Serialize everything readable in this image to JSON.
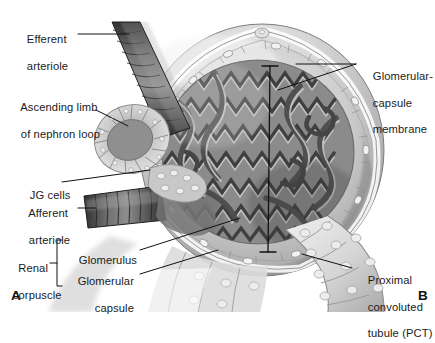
{
  "figure": {
    "background_color": "#ffffff",
    "text_color": "#1b1b1b",
    "leader_line_color": "#111111"
  },
  "panels": [
    {
      "id": "A",
      "label": "A",
      "x": 11,
      "y": 288
    },
    {
      "id": "B",
      "label": "B",
      "x": 418,
      "y": 288
    }
  ],
  "labels": {
    "efferent_arteriole": {
      "line1": "Efferent",
      "line2": "arteriole"
    },
    "ascending_limb": {
      "line1": "Ascending limb",
      "line2": "of nephron loop"
    },
    "jg_cells": {
      "line1": "JG cells"
    },
    "afferent_arteriole": {
      "line1": "Afferent",
      "line2": "arteriole"
    },
    "renal_corpuscle": {
      "line1": "Renal",
      "line2": "corpuscle"
    },
    "glomerulus": {
      "line1": "Glomerulus"
    },
    "glomerular_capsule": {
      "line1": "Glomerular",
      "line2": "capsule"
    },
    "glomerular_capsule_membrane": {
      "line1": "Glomerular-",
      "line2": "capsule",
      "line3": "membrane"
    },
    "proximal_convoluted_tubule": {
      "line1": "Proximal",
      "line2": "convoluted",
      "line3": "tubule (PCT)"
    }
  },
  "structures": {
    "efferent_arteriole": "segmented dark vascular tube entering from upper area",
    "afferent_arteriole": "segmented dark vascular tube entering from left",
    "ascending_limb": "cup-shaped cellular tubule cross-section at left",
    "jg_cells": "juxtaglomerular cell cluster at arteriole wall",
    "glomerulus": "dense mass of convoluted capillary loops",
    "glomerular_capsule": "outer rounded capsule shell surrounding glomerulus",
    "glomerular_capsule_membrane": "thin inner epithelial cell layer lining capsule",
    "proximal_convoluted_tubule": "tubule of cuboidal epithelial cells at lower right"
  },
  "palette": {
    "capsule_light": "#e9e9e9",
    "capsule_mid": "#c9c9c9",
    "capsule_shadow": "#8e8e8e",
    "glomerulus_dark": "#4a4a4a",
    "glomerulus_mid": "#7d7d7d",
    "glomerulus_light": "#c4c4c4",
    "arteriole_dark": "#3d3d3d",
    "arteriole_mid": "#6e6e6e",
    "tubule_light": "#dedede",
    "tubule_line": "#9a9a9a"
  }
}
